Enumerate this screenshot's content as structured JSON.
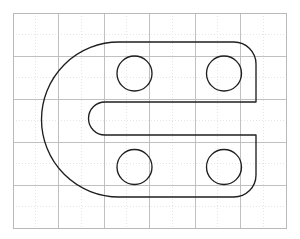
{
  "canvas": {
    "width": 300,
    "height": 239,
    "background_color": "#ffffff",
    "title": "Engineering part outline on graph paper"
  },
  "grid": {
    "visible": true,
    "border_color": "#b9b9b9",
    "major_line_color": "#b9b9b9",
    "minor_line_color": "#dedede",
    "left": 13,
    "top": 13,
    "right": 286,
    "bottom": 228,
    "major_x": [
      13,
      58,
      104,
      149,
      195,
      240,
      286
    ],
    "major_y": [
      13,
      56,
      99,
      142,
      185,
      228
    ],
    "minor_x": [
      35,
      81,
      126,
      172,
      217,
      263
    ],
    "minor_y": [
      34,
      77,
      120,
      163,
      206
    ]
  },
  "part": {
    "name": "d-shaped-slotted-bracket",
    "stroke_color": "#1f1f1f",
    "fill_color": "none",
    "stroke_width": 1.35,
    "outline_path": "M 119 42 L 234 42 A 22 22 0 0 1 256 64 L 256 102 L 105 102 A 16.5 16.5 0 0 0 105 135 L 256 135 L 256 175 A 22 22 0 0 1 234 197 L 119 197 A 77.5 77.5 0 0 1 119 42 Z",
    "outer_left_x": 34,
    "outer_right_x": 256,
    "outer_top_y": 42,
    "outer_bottom_y": 197,
    "left_arc_radius": 77.5,
    "left_arc_center_y": 119.5,
    "corner_radius": 22,
    "slot": {
      "name": "horizontal-keyway-slot",
      "top_y": 102,
      "bottom_y": 135,
      "cap_center_x": 105,
      "cap_radius": 16.5,
      "open_edge_x": 256
    },
    "holes": [
      {
        "name": "hole-top-left",
        "cx": 134.5,
        "cy": 73.5,
        "r": 17.5
      },
      {
        "name": "hole-top-right",
        "cx": 224.0,
        "cy": 73.5,
        "r": 17.5
      },
      {
        "name": "hole-bottom-left",
        "cx": 134.5,
        "cy": 167.0,
        "r": 17.5
      },
      {
        "name": "hole-bottom-right",
        "cx": 224.0,
        "cy": 167.0,
        "r": 17.5
      }
    ]
  }
}
